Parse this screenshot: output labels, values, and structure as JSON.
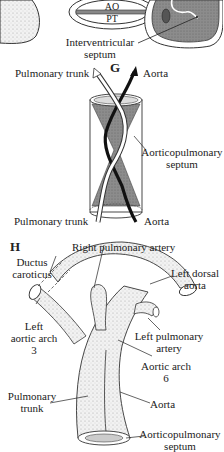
{
  "top_fragment": {
    "oval_top_label": "AO",
    "oval_bottom_label": "PT",
    "septum_label_line1": "Interventricular",
    "septum_label_line2": "septum"
  },
  "panel_g": {
    "letter": "G",
    "pulmonary_trunk_top": "Pulmonary trunk",
    "aorta_top": "Aorta",
    "septum_line1": "Aorticopulmonary",
    "septum_line2": "septum",
    "pulmonary_trunk_bottom": "Pulmonary trunk",
    "aorta_bottom": "Aorta"
  },
  "panel_h": {
    "letter": "H",
    "right_pulmonary_artery": "Right pulmonary artery",
    "ductus_line1": "Ductus",
    "ductus_line2": "caroticus",
    "left_dorsal_line1": "Left dorsal",
    "left_dorsal_line2": "aorta",
    "left_aortic_line1": "Left",
    "left_aortic_line2": "aortic arch",
    "left_aortic_line3": "3",
    "left_pulmonary_line1": "Left pulmonary",
    "left_pulmonary_line2": "artery",
    "aortic_arch6_line1": "Aortic arch",
    "aortic_arch6_line2": "6",
    "pulmonary_trunk_line1": "Pulmonary",
    "pulmonary_trunk_line2": "trunk",
    "aorta": "Aorta",
    "ap_septum_line1": "Aorticopulmonary",
    "ap_septum_line2": "septum"
  },
  "colors": {
    "ink": "#222222",
    "shade": "#8a8a8a",
    "light_shade": "#e4e4e4"
  }
}
